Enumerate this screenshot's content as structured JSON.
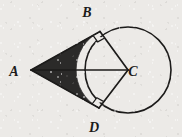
{
  "figure": {
    "background_color": "#eceae7",
    "stroke_color": "#1c1b1a",
    "shade_color": "#2b2a29",
    "circle_fill": "#eceae7"
  },
  "labels": {
    "a": "A",
    "b": "B",
    "c": "C",
    "d": "D"
  },
  "label_positions": {
    "a": {
      "x": 14,
      "y": 76
    },
    "b": {
      "x": 87,
      "y": 17
    },
    "c": {
      "x": 133,
      "y": 76
    },
    "d": {
      "x": 94,
      "y": 132
    }
  },
  "geometry": {
    "circle": {
      "cx": 128,
      "cy": 70,
      "r": 43
    },
    "point_a": {
      "x": 31,
      "y": 70
    },
    "point_b": {
      "x": 100.0,
      "y": 31.5
    },
    "point_c": {
      "x": 128,
      "y": 70
    },
    "point_d": {
      "x": 99.0,
      "y": 108.0
    }
  },
  "segments": [
    {
      "name": "tangent-ab",
      "from": "A",
      "to": "B"
    },
    {
      "name": "tangent-ad",
      "from": "A",
      "to": "D"
    },
    {
      "name": "segment-ac",
      "from": "A",
      "to": "C"
    },
    {
      "name": "radius-cb",
      "from": "C",
      "to": "B"
    },
    {
      "name": "radius-cd",
      "from": "C",
      "to": "D"
    }
  ],
  "right_angle_marks": [
    {
      "name": "right-angle-at-b",
      "at": "B"
    },
    {
      "name": "right-angle-at-d",
      "at": "D"
    }
  ],
  "shaded_region": {
    "name": "shaded-region-abd",
    "description": "Region bounded by tangent AB, tangent AD and the near arc from B to D"
  }
}
